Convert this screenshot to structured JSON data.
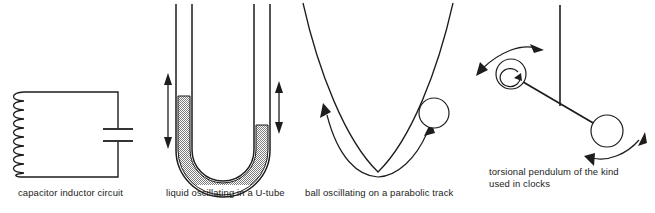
{
  "figure": {
    "background_color": "#ffffff",
    "ink_color": "#1d1d1b",
    "fill_pattern_color": "#8c8c8c",
    "panels": [
      {
        "id": "capacitor-inductor-circuit",
        "caption": "capacitor inductor circuit",
        "elements": [
          "inductor-coil",
          "capacitor-plates",
          "circuit-loop-wire"
        ]
      },
      {
        "id": "u-tube",
        "caption": "liquid oscillating in a U-tube",
        "elements": [
          "u-tube-glass",
          "liquid-fill",
          "left-double-arrow",
          "right-double-arrow"
        ]
      },
      {
        "id": "parabolic-track",
        "caption": "ball oscillating on a parabolic track",
        "elements": [
          "parabola-curve",
          "ball",
          "double-headed-curved-arrow"
        ]
      },
      {
        "id": "torsional-pendulum",
        "caption": "torsional pendulum of the kind\nused in clocks",
        "elements": [
          "vertical-rod",
          "horizontal-bar",
          "left-ball",
          "right-ball",
          "upper-curved-arrow",
          "lower-curved-arrow",
          "rotation-loop-arrow"
        ]
      }
    ]
  },
  "captions": {
    "circuit": "capacitor inductor circuit",
    "utube": "liquid oscillating in a U-tube",
    "track": "ball oscillating on a parabolic track",
    "pendulum": "torsional pendulum of the kind\nused in clocks"
  }
}
